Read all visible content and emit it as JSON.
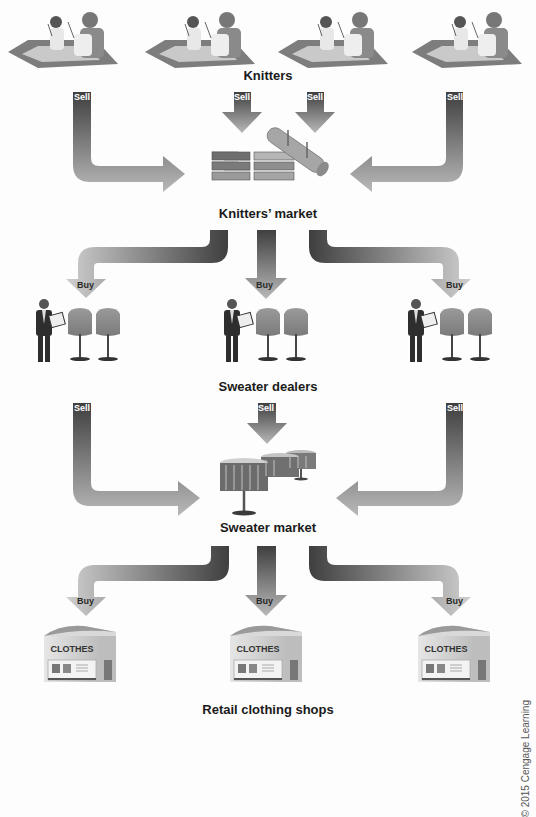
{
  "diagram": {
    "type": "market flow diagram",
    "levels": [
      {
        "id": "knitters",
        "label": "Knitters",
        "count": 4,
        "icon": "knitter-people-icon"
      },
      {
        "id": "knitters_market",
        "label": "Knitters’ market",
        "icon": "fabric-bolts-icon"
      },
      {
        "id": "sweater_dealers",
        "label": "Sweater dealers",
        "count": 3,
        "icon": "dealer-with-sweater-racks-icon"
      },
      {
        "id": "sweater_market",
        "label": "Sweater market",
        "icon": "market-tables-icon"
      },
      {
        "id": "retail_shops",
        "label": "Retail clothing shops",
        "count": 3,
        "icon": "clothes-store-icon"
      }
    ],
    "arrows": {
      "sell_label": "Sell",
      "buy_label": "Buy"
    },
    "store_sign": "CLOTHES",
    "colors": {
      "arrow_dark": "#4a4a4a",
      "arrow_light": "#c8c8c8",
      "text": "#1a1a1a",
      "background": "#fdfdfd"
    }
  },
  "credit": "© 2015 Cengage Learning"
}
